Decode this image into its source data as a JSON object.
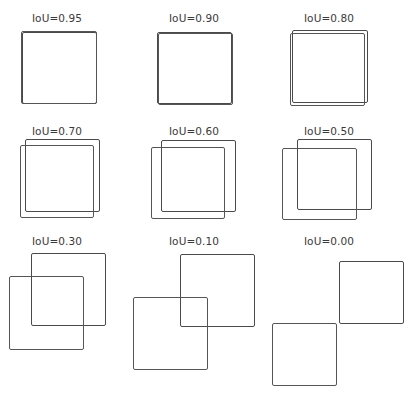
{
  "figure": {
    "title": "",
    "panels": [
      {
        "label": "IoU=0.95",
        "label_pos": [
          57,
          12
        ],
        "box_a": {
          "x": 22,
          "y": 32,
          "w": 75,
          "h": 72
        },
        "box_b": {
          "x": 21,
          "y": 31,
          "w": 76,
          "h": 73
        }
      },
      {
        "label": "IoU=0.90",
        "label_pos": [
          194,
          12
        ],
        "box_a": {
          "x": 157,
          "y": 32,
          "w": 75,
          "h": 72
        },
        "box_b": {
          "x": 158,
          "y": 33,
          "w": 75,
          "h": 72
        }
      },
      {
        "label": "IoU=0.80",
        "label_pos": [
          329,
          12
        ],
        "box_a": {
          "x": 292,
          "y": 30,
          "w": 76,
          "h": 73
        },
        "box_b": {
          "x": 290,
          "y": 33,
          "w": 75,
          "h": 73
        }
      },
      {
        "label": "IoU=0.70",
        "label_pos": [
          57,
          125
        ],
        "box_a": {
          "x": 25,
          "y": 139,
          "w": 75,
          "h": 73
        },
        "box_b": {
          "x": 20,
          "y": 145,
          "w": 74,
          "h": 73
        }
      },
      {
        "label": "IoU=0.60",
        "label_pos": [
          194,
          125
        ],
        "box_a": {
          "x": 161,
          "y": 140,
          "w": 75,
          "h": 72
        },
        "box_b": {
          "x": 151,
          "y": 147,
          "w": 74,
          "h": 72
        }
      },
      {
        "label": "IoU=0.50",
        "label_pos": [
          329,
          125
        ],
        "box_a": {
          "x": 297,
          "y": 139,
          "w": 75,
          "h": 71
        },
        "box_b": {
          "x": 282,
          "y": 148,
          "w": 75,
          "h": 72
        }
      },
      {
        "label": "IoU=0.30",
        "label_pos": [
          57,
          235
        ],
        "box_a": {
          "x": 31,
          "y": 253,
          "w": 75,
          "h": 73
        },
        "box_b": {
          "x": 9,
          "y": 276,
          "w": 75,
          "h": 74
        }
      },
      {
        "label": "IoU=0.10",
        "label_pos": [
          194,
          235
        ],
        "box_a": {
          "x": 180,
          "y": 254,
          "w": 75,
          "h": 73
        },
        "box_b": {
          "x": 133,
          "y": 297,
          "w": 75,
          "h": 73
        }
      },
      {
        "label": "IoU=0.00",
        "label_pos": [
          329,
          235
        ],
        "box_a": {
          "x": 339,
          "y": 261,
          "w": 65,
          "h": 63
        },
        "box_b": {
          "x": 272,
          "y": 323,
          "w": 65,
          "h": 63
        }
      }
    ]
  },
  "colors": {
    "box_stroke": "#4a4a4a",
    "label_text": "#3a3a3a",
    "background": "#ffffff"
  }
}
